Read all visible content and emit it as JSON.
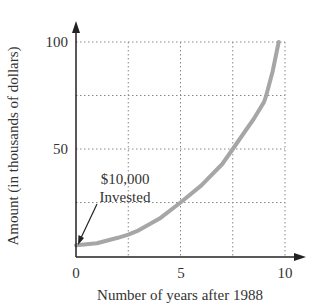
{
  "chart_data": {
    "type": "line",
    "title": "",
    "xlabel": "Number of years after 1988",
    "ylabel": "Amount (in thousands of dollars)",
    "xlim": [
      0,
      10
    ],
    "ylim": [
      0,
      100
    ],
    "x_ticks": [
      "0",
      "5",
      "10"
    ],
    "y_ticks": [
      "50",
      "100"
    ],
    "grid": true,
    "grid_x_step": 2.5,
    "grid_y_step": 25,
    "series": [
      {
        "name": "Investment growth",
        "color": "#a6a6a6",
        "x": [
          0,
          1,
          2,
          2.5,
          3,
          4,
          5,
          6,
          7,
          7.5,
          8,
          8.5,
          9,
          9.1,
          9.4,
          9.7
        ],
        "y": [
          5,
          6,
          8.5,
          10,
          12,
          17.5,
          25,
          33,
          43,
          50,
          57,
          64,
          72,
          75,
          86,
          100
        ]
      }
    ],
    "annotations": [
      {
        "text_line1": "$10,000",
        "text_line2": "Invested",
        "points_to": [
          0,
          5
        ]
      }
    ]
  },
  "labels": {
    "x_tick_0": "0",
    "x_tick_5": "5",
    "x_tick_10": "10",
    "y_tick_50": "50",
    "y_tick_100": "100",
    "xlabel": "Number of years after 1988",
    "ylabel": "Amount (in thousands of dollars)",
    "annotation_line1": "$10,000",
    "annotation_line2": "Invested"
  }
}
